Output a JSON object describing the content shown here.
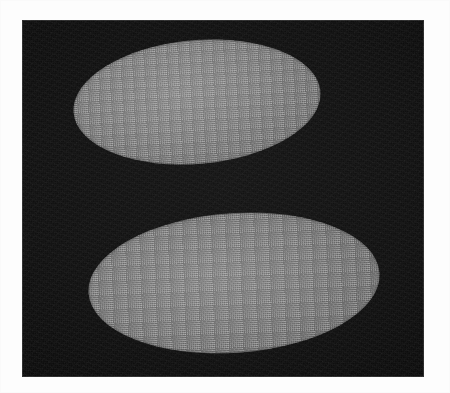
{
  "figure": {
    "kind": "grayscale-raster-image",
    "modality_look": "noisy grayscale scan",
    "caption": "",
    "alt_text": "Two light gray ellipses on a near-black noisy background",
    "page_background": "#fdfdfd",
    "canvas": {
      "width": 450,
      "height": 393
    }
  },
  "panel": {
    "name": "image-panel",
    "left": 22,
    "top": 20,
    "width": 402,
    "height": 357,
    "background_color": "#0c0c0c",
    "background_description": "near-black field with fine speckle noise",
    "border_color": "#ffffff"
  },
  "objects": [
    {
      "id": "ellipse-upper",
      "label": "upper ellipse",
      "shape": "ellipse",
      "fill_color": "#8f8f8f",
      "center_x": 197,
      "center_y": 102,
      "semi_axis_x": 124,
      "semi_axis_y": 62,
      "rotation_deg": -5,
      "relative_intensity": "bright"
    },
    {
      "id": "ellipse-lower",
      "label": "lower ellipse",
      "shape": "ellipse",
      "fill_color": "#8a8a8a",
      "center_x": 234,
      "center_y": 283,
      "semi_axis_x": 146,
      "semi_axis_y": 70,
      "rotation_deg": -4,
      "relative_intensity": "bright"
    }
  ],
  "colors": {
    "background_dark": "#0c0c0c",
    "object_gray": "#8f8f8f",
    "page_white": "#ffffff"
  }
}
